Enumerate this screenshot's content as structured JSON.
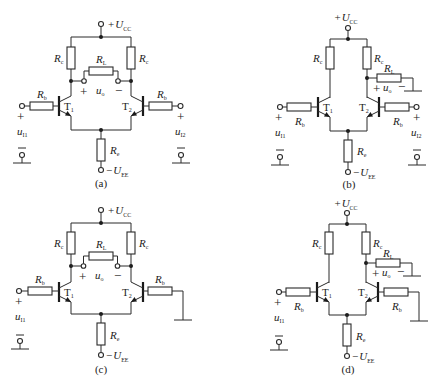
{
  "figure": {
    "panels": [
      {
        "id": "a",
        "caption": "(a)",
        "supply_pos": {
          "sign": "+",
          "symbol": "U",
          "sub": "CC"
        },
        "supply_neg": {
          "sign": "−",
          "symbol": "U",
          "sub": "EE"
        },
        "Rc_left": {
          "symbol": "R",
          "sub": "c"
        },
        "Rc_right": {
          "symbol": "R",
          "sub": "c"
        },
        "RL": {
          "symbol": "R",
          "sub": "L"
        },
        "Rb_left": {
          "symbol": "R",
          "sub": "b"
        },
        "Rb_right": {
          "symbol": "R",
          "sub": "b"
        },
        "Re": {
          "symbol": "R",
          "sub": "e"
        },
        "T1": {
          "symbol": "T",
          "sub": "1"
        },
        "T2": {
          "symbol": "T",
          "sub": "2"
        },
        "uo": {
          "symbol": "u",
          "sub": "o",
          "plus": "+",
          "minus": "−"
        },
        "ui1": {
          "symbol": "u",
          "sub": "I1",
          "plus": "+"
        },
        "ui2": {
          "symbol": "u",
          "sub": "I2",
          "plus": "+"
        }
      },
      {
        "id": "b",
        "caption": "(b)",
        "supply_pos": {
          "sign": "+",
          "symbol": "U",
          "sub": "CC"
        },
        "supply_neg": {
          "sign": "−",
          "symbol": "U",
          "sub": "EE"
        },
        "Rc_left": {
          "symbol": "R",
          "sub": "c"
        },
        "Rc_right": {
          "symbol": "R",
          "sub": "c"
        },
        "RL": {
          "symbol": "R",
          "sub": "L"
        },
        "Rb_left": {
          "symbol": "R",
          "sub": "b"
        },
        "Rb_right": {
          "symbol": "R",
          "sub": "b"
        },
        "Re": {
          "symbol": "R",
          "sub": "e"
        },
        "T1": {
          "symbol": "T",
          "sub": "1"
        },
        "T2": {
          "symbol": "T",
          "sub": "2"
        },
        "uo": {
          "symbol": "u",
          "sub": "o",
          "plus": "+",
          "minus": "−"
        },
        "ui1": {
          "symbol": "u",
          "sub": "I1",
          "plus": "+"
        },
        "ui2": {
          "symbol": "u",
          "sub": "I2",
          "plus": "+"
        }
      },
      {
        "id": "c",
        "caption": "(c)",
        "supply_pos": {
          "sign": "+",
          "symbol": "U",
          "sub": "CC"
        },
        "supply_neg": {
          "sign": "−",
          "symbol": "U",
          "sub": "EE"
        },
        "Rc_left": {
          "symbol": "R",
          "sub": "c"
        },
        "Rc_right": {
          "symbol": "R",
          "sub": "c"
        },
        "RL": {
          "symbol": "R",
          "sub": "L"
        },
        "Rb_left": {
          "symbol": "R",
          "sub": "b"
        },
        "Rb_right": {
          "symbol": "R",
          "sub": "b"
        },
        "Re": {
          "symbol": "R",
          "sub": "e"
        },
        "T1": {
          "symbol": "T",
          "sub": "1"
        },
        "T2": {
          "symbol": "T",
          "sub": "2"
        },
        "uo": {
          "symbol": "u",
          "sub": "o",
          "plus": "+",
          "minus": "−"
        },
        "ui1": {
          "symbol": "u",
          "sub": "I1",
          "plus": "+"
        }
      },
      {
        "id": "d",
        "caption": "(d)",
        "supply_pos": {
          "sign": "+",
          "symbol": "U",
          "sub": "CC"
        },
        "supply_neg": {
          "sign": "−",
          "symbol": "U",
          "sub": "EE"
        },
        "Rc_left": {
          "symbol": "R",
          "sub": "c"
        },
        "Rc_right": {
          "symbol": "R",
          "sub": "c"
        },
        "RL": {
          "symbol": "R",
          "sub": "L"
        },
        "Rb_left": {
          "symbol": "R",
          "sub": "b"
        },
        "Rb_right": {
          "symbol": "R",
          "sub": "b"
        },
        "Re": {
          "symbol": "R",
          "sub": "e"
        },
        "T1": {
          "symbol": "T",
          "sub": "1"
        },
        "T2": {
          "symbol": "T",
          "sub": "2"
        },
        "uo": {
          "symbol": "u",
          "sub": "o",
          "plus": "+",
          "minus": "−"
        },
        "ui1": {
          "symbol": "u",
          "sub": "I1",
          "plus": "+"
        }
      }
    ]
  }
}
